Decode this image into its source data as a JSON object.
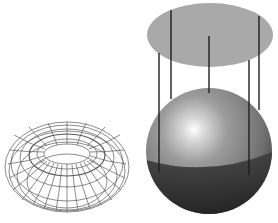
{
  "figure": {
    "width": 278,
    "height": 223,
    "background": "#ffffff",
    "torus": {
      "label": "wireframe-torus",
      "cx": 67,
      "cy": 167,
      "rx": 62,
      "ry": 45,
      "hole_rx": 22,
      "hole_ry": 10,
      "stroke": "#555555"
    },
    "sphere": {
      "label": "shaded-sphere",
      "cx": 209,
      "cy": 151,
      "r": 63,
      "highlight": {
        "cx": 190,
        "cy": 127
      },
      "base_color": "#8a8a8a",
      "dark_color": "#3a3a3a"
    },
    "disk": {
      "label": "projection-plane-ellipse",
      "cx": 210,
      "cy": 35,
      "rx": 63,
      "ry": 32,
      "fill": "#a9a9a9"
    },
    "rays": [
      {
        "x": 171,
        "y1": 10,
        "y2": 99
      },
      {
        "x": 209,
        "y1": 36,
        "y2": 93
      },
      {
        "x": 259,
        "y1": 16,
        "y2": 110
      },
      {
        "x": 159,
        "y1": 53,
        "y2": 172
      },
      {
        "x": 249,
        "y1": 60,
        "y2": 175
      }
    ]
  }
}
